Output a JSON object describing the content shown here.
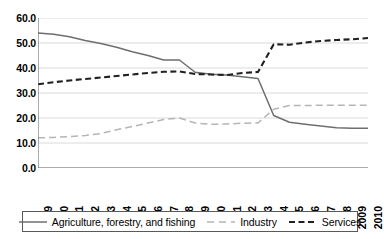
{
  "chart_data": {
    "type": "line",
    "title": "",
    "xlabel": "",
    "ylabel": "",
    "xlim": [
      1989,
      2010
    ],
    "ylim": [
      0.0,
      60.0
    ],
    "grid": true,
    "legend_position": "bottom",
    "categories": [
      "1989",
      "1990",
      "1991",
      "1992",
      "1993",
      "1994",
      "1995",
      "1996",
      "1997",
      "1998",
      "1999",
      "2000",
      "2001",
      "2002",
      "2003",
      "2004",
      "2005",
      "2006",
      "2007",
      "2008",
      "2009",
      "2010"
    ],
    "ytick_labels": [
      "60.0",
      "50.0",
      "40.0",
      "30.0",
      "20.0",
      "10.0",
      "0.0"
    ],
    "ytick_values": [
      60.0,
      50.0,
      40.0,
      30.0,
      20.0,
      10.0,
      0.0
    ],
    "series": [
      {
        "name": "Agriculture, forestry, and fishing",
        "style": "solid",
        "color": "#6d6e70",
        "values": [
          54.0,
          53.5,
          52.5,
          51.0,
          49.8,
          48.3,
          46.5,
          45.0,
          43.2,
          43.2,
          38.3,
          37.5,
          37.2,
          36.5,
          35.8,
          21.0,
          18.3,
          17.5,
          16.8,
          16.1,
          15.9,
          15.9
        ]
      },
      {
        "name": "Industry",
        "style": "dashed",
        "color": "#b4b5b7",
        "values": [
          12.1,
          12.2,
          12.6,
          13.0,
          13.8,
          15.3,
          16.6,
          18.0,
          19.4,
          20.0,
          18.0,
          17.5,
          17.6,
          17.9,
          18.0,
          23.5,
          25.0,
          25.0,
          25.1,
          25.1,
          25.1,
          25.1
        ]
      },
      {
        "name": "Services",
        "style": "dashed",
        "color": "#231f20",
        "values": [
          33.5,
          34.3,
          35.0,
          35.6,
          36.2,
          36.8,
          37.4,
          38.0,
          38.5,
          38.6,
          37.6,
          37.4,
          37.2,
          38.0,
          38.4,
          49.5,
          49.3,
          50.2,
          50.8,
          51.2,
          51.5,
          52.0
        ]
      }
    ]
  },
  "legend": {
    "entries": [
      {
        "label": "Agriculture, forestry, and fishing"
      },
      {
        "label": "Industry"
      },
      {
        "label": "Services"
      }
    ]
  }
}
